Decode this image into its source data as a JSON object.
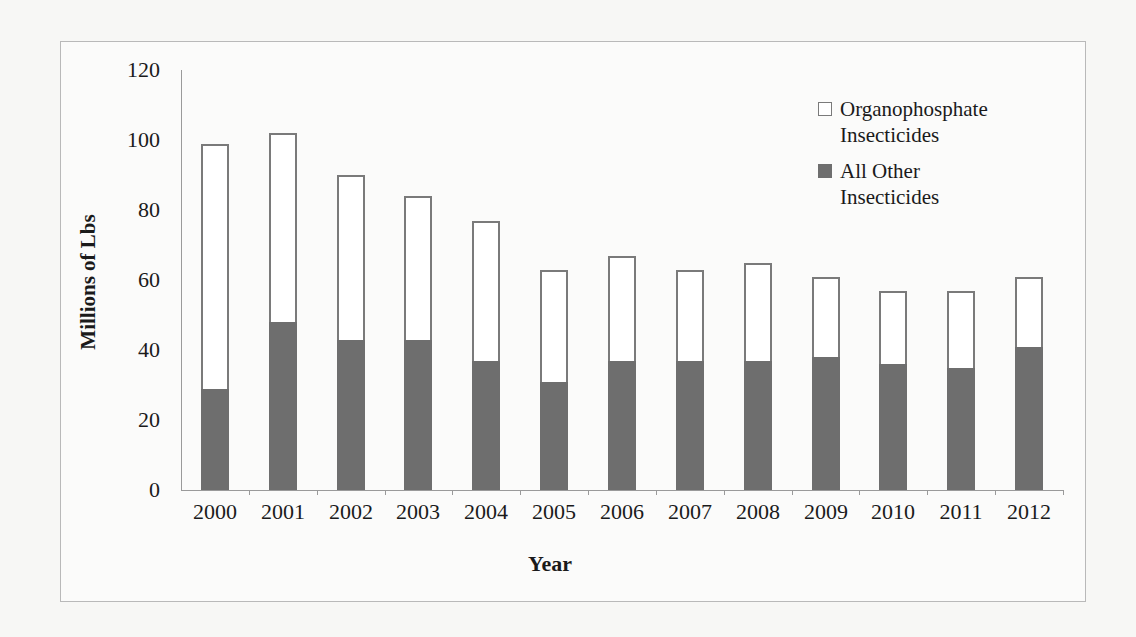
{
  "chart_data": {
    "type": "bar",
    "stacked": true,
    "title": "",
    "xlabel": "Year",
    "ylabel": "Millions of Lbs",
    "ylim": [
      0,
      120
    ],
    "yticks": [
      0,
      20,
      40,
      60,
      80,
      100,
      120
    ],
    "grid": false,
    "legend_position": "top-right",
    "categories": [
      "2000",
      "2001",
      "2002",
      "2003",
      "2004",
      "2005",
      "2006",
      "2007",
      "2008",
      "2009",
      "2010",
      "2011",
      "2012"
    ],
    "series": [
      {
        "name": "All Other Insecticides",
        "color": "#6e6e6e",
        "values": [
          29,
          48,
          43,
          43,
          37,
          31,
          37,
          37,
          37,
          38,
          36,
          35,
          41
        ]
      },
      {
        "name": "Organophosphate Insecticides",
        "color": "#ffffff",
        "values": [
          70,
          54,
          47,
          41,
          40,
          32,
          30,
          26,
          28,
          23,
          21,
          22,
          20
        ]
      }
    ],
    "totals": [
      99,
      102,
      90,
      84,
      77,
      63,
      67,
      63,
      65,
      61,
      57,
      57,
      61
    ]
  },
  "axes": {
    "y_title": "Millions of Lbs",
    "x_title": "Year",
    "y_tick_labels": [
      "0",
      "20",
      "40",
      "60",
      "80",
      "100",
      "120"
    ]
  },
  "legend": {
    "items": [
      {
        "line1": "Organophosphate",
        "line2": "Insecticides",
        "swatch": "white"
      },
      {
        "line1": "All Other",
        "line2": "Insecticides",
        "swatch": "dark"
      }
    ]
  }
}
